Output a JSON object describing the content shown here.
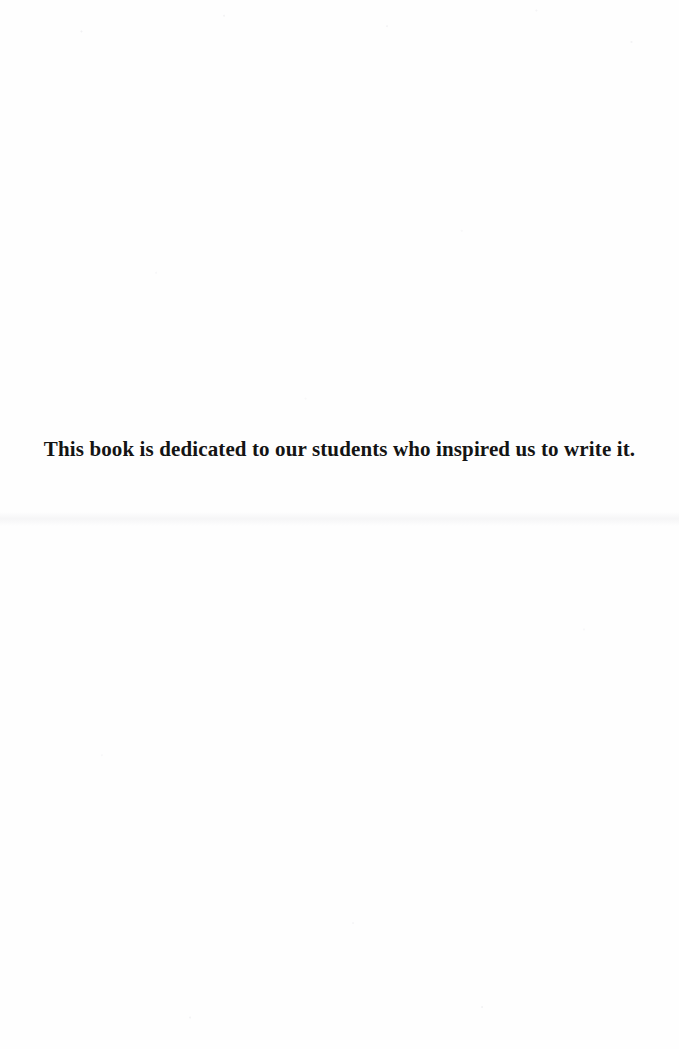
{
  "page": {
    "type": "book-dedication-page",
    "background_color": "#fefefe",
    "text_color": "#141414",
    "width": 679,
    "height": 1049
  },
  "dedication": {
    "text": "This book is dedicated to our students who inspired us to write it."
  }
}
